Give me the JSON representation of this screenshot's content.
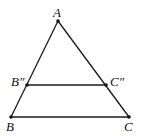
{
  "diagram": {
    "type": "triangle-with-midline",
    "points": {
      "A": {
        "label": "A",
        "x": 58,
        "y": 21
      },
      "B2": {
        "label": "B″",
        "x": 27,
        "y": 85
      },
      "C2": {
        "label": "C″",
        "x": 106,
        "y": 85
      },
      "B": {
        "label": "B",
        "x": 11,
        "y": 117
      },
      "C": {
        "label": "C",
        "x": 129,
        "y": 117
      }
    },
    "segments": [
      [
        "A",
        "B"
      ],
      [
        "A",
        "C"
      ],
      [
        "B",
        "C"
      ],
      [
        "B2",
        "C2"
      ]
    ],
    "colors": {
      "stroke": "#1a1a1a",
      "background": "#ffffff"
    }
  }
}
